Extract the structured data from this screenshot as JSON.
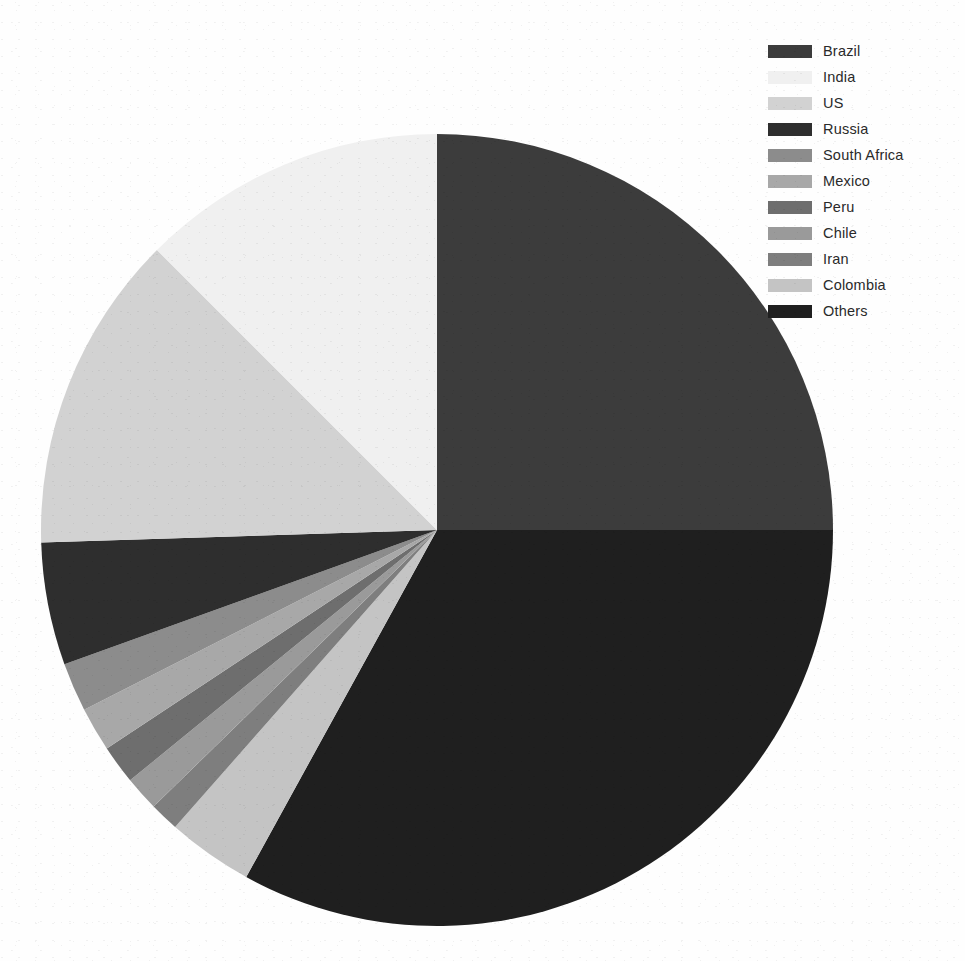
{
  "chart_data": {
    "type": "pie",
    "title": "",
    "subtitle": "",
    "xlabel": "",
    "ylabel": "",
    "legend_position": "top-right",
    "grid": false,
    "start_angle_deg": 0,
    "direction": "clockwise",
    "categories": [
      "Brazil",
      "India",
      "US",
      "Russia",
      "South Africa",
      "Mexico",
      "Peru",
      "Chile",
      "Iran",
      "Colombia",
      "Others"
    ],
    "values": [
      25.0,
      12.5,
      13.0,
      5.0,
      2.0,
      1.8,
      1.6,
      1.4,
      1.2,
      3.5,
      33.0
    ],
    "colors": [
      "#3c3c3c",
      "#f0f0f0",
      "#d2d2d2",
      "#2e2e2e",
      "#8c8c8c",
      "#a8a8a8",
      "#6e6e6e",
      "#9a9a9a",
      "#7e7e7e",
      "#c4c4c4",
      "#1f1f1f"
    ],
    "slices": [
      {
        "label": "Brazil",
        "value": 25.0,
        "color": "#3c3c3c",
        "start_deg": 0.0,
        "end_deg": 90.0
      },
      {
        "label": "Others",
        "value": 33.0,
        "color": "#1f1f1f",
        "start_deg": 90.0,
        "end_deg": 208.8
      },
      {
        "label": "Colombia",
        "value": 3.5,
        "color": "#c4c4c4",
        "start_deg": 208.8,
        "end_deg": 221.4
      },
      {
        "label": "Iran",
        "value": 1.2,
        "color": "#7e7e7e",
        "start_deg": 221.4,
        "end_deg": 225.7
      },
      {
        "label": "Chile",
        "value": 1.4,
        "color": "#9a9a9a",
        "start_deg": 225.7,
        "end_deg": 230.8
      },
      {
        "label": "Peru",
        "value": 1.6,
        "color": "#6e6e6e",
        "start_deg": 230.8,
        "end_deg": 236.5
      },
      {
        "label": "Mexico",
        "value": 1.8,
        "color": "#a8a8a8",
        "start_deg": 236.5,
        "end_deg": 243.0
      },
      {
        "label": "South Africa",
        "value": 2.0,
        "color": "#8c8c8c",
        "start_deg": 243.0,
        "end_deg": 250.2
      },
      {
        "label": "Russia",
        "value": 5.0,
        "color": "#2e2e2e",
        "start_deg": 250.2,
        "end_deg": 268.2
      },
      {
        "label": "US",
        "value": 13.0,
        "color": "#d2d2d2",
        "start_deg": 268.2,
        "end_deg": 315.0
      },
      {
        "label": "India",
        "value": 12.5,
        "color": "#f0f0f0",
        "start_deg": 315.0,
        "end_deg": 360.0
      }
    ],
    "geometry": {
      "center_x": 437,
      "center_y": 530,
      "radius": 396
    }
  },
  "legend": {
    "items": [
      {
        "label": "Brazil",
        "color": "#3c3c3c"
      },
      {
        "label": "India",
        "color": "#f0f0f0"
      },
      {
        "label": "US",
        "color": "#d2d2d2"
      },
      {
        "label": "Russia",
        "color": "#2e2e2e"
      },
      {
        "label": "South Africa",
        "color": "#8c8c8c"
      },
      {
        "label": "Mexico",
        "color": "#a8a8a8"
      },
      {
        "label": "Peru",
        "color": "#6e6e6e"
      },
      {
        "label": "Chile",
        "color": "#9a9a9a"
      },
      {
        "label": "Iran",
        "color": "#7e7e7e"
      },
      {
        "label": "Colombia",
        "color": "#c4c4c4"
      },
      {
        "label": "Others",
        "color": "#1f1f1f"
      }
    ]
  }
}
